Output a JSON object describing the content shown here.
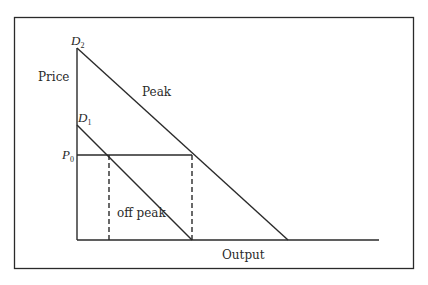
{
  "diagram": {
    "type": "peak-load-pricing",
    "axes": {
      "y_label": "Price",
      "x_label": "Output"
    },
    "curves": [
      {
        "id": "D2",
        "letter": "D",
        "subscript": "2",
        "name": "Peak"
      },
      {
        "id": "D1",
        "letter": "D",
        "subscript": "1",
        "name": "off peak"
      }
    ],
    "price_level": {
      "letter": "P",
      "subscript": "0"
    }
  }
}
